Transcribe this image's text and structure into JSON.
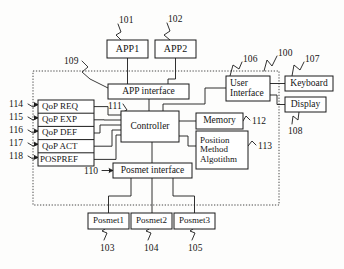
{
  "figure": {
    "boundary_name": "system-boundary-dashed",
    "line_color": "#1a1a1a",
    "box_fill": "#ffffff",
    "background": "#fdfdfc"
  },
  "blocks": {
    "app1": {
      "label": "APP1",
      "x": 107,
      "y": 40,
      "w": 41,
      "h": 18,
      "fs": 10
    },
    "app2": {
      "label": "APP2",
      "x": 155,
      "y": 40,
      "w": 41,
      "h": 18,
      "fs": 10
    },
    "app_interface": {
      "label": "APP interface",
      "x": 108,
      "y": 84,
      "w": 81,
      "h": 15,
      "fs": 9.5
    },
    "controller": {
      "label": "Controller",
      "x": 121,
      "y": 111,
      "w": 58,
      "h": 31,
      "fs": 9.5
    },
    "memory": {
      "label": "Memory",
      "x": 196,
      "y": 113,
      "w": 47,
      "h": 16,
      "fs": 9.5
    },
    "position_method": {
      "label": "Position\nMethod\nAlgotithm",
      "x": 196,
      "y": 131,
      "w": 52,
      "h": 38,
      "fs": 9
    },
    "user_interface": {
      "label": "User\nInterface",
      "x": 226,
      "y": 76,
      "w": 44,
      "h": 25,
      "fs": 9.5
    },
    "keyboard": {
      "label": "Keyboard",
      "x": 285,
      "y": 76,
      "w": 48,
      "h": 15,
      "fs": 9.5
    },
    "display": {
      "label": "Display",
      "x": 285,
      "y": 97,
      "w": 41,
      "h": 15,
      "fs": 9.5
    },
    "posmet_interface": {
      "label": "Posmet interface",
      "x": 113,
      "y": 163,
      "w": 79,
      "h": 15,
      "fs": 9.5
    },
    "posmet1": {
      "label": "Posmet1",
      "x": 88,
      "y": 213,
      "w": 41,
      "h": 16,
      "fs": 9
    },
    "posmet2": {
      "label": "Posmet2",
      "x": 131,
      "y": 213,
      "w": 41,
      "h": 16,
      "fs": 9
    },
    "posmet3": {
      "label": "Posmet3",
      "x": 174,
      "y": 213,
      "w": 41,
      "h": 16,
      "fs": 9
    }
  },
  "qop_stack": {
    "x": 38,
    "y": 100,
    "w": 56,
    "row_h": 13.2,
    "rows": [
      {
        "label": "QoP REQ",
        "ref": "114"
      },
      {
        "label": "QoP EXP",
        "ref": "115"
      },
      {
        "label": "QoP DEF",
        "ref": "116"
      },
      {
        "label": "QoP ACT",
        "ref": "117"
      },
      {
        "label": "POSPREF",
        "ref": "118"
      }
    ],
    "fs": 9
  },
  "ref_numbers": [
    {
      "id": "ref-101",
      "text": "101",
      "x": 119,
      "y": 15
    },
    {
      "id": "ref-102",
      "text": "102",
      "x": 168,
      "y": 14
    },
    {
      "id": "ref-109",
      "text": "109",
      "x": 64,
      "y": 56
    },
    {
      "id": "ref-106",
      "text": "106",
      "x": 243,
      "y": 54
    },
    {
      "id": "ref-100",
      "text": "100",
      "x": 278,
      "y": 48
    },
    {
      "id": "ref-107",
      "text": "107",
      "x": 305,
      "y": 54
    },
    {
      "id": "ref-108",
      "text": "108",
      "x": 288,
      "y": 126
    },
    {
      "id": "ref-111",
      "text": "111",
      "x": 108,
      "y": 101
    },
    {
      "id": "ref-112",
      "text": "112",
      "x": 252,
      "y": 116
    },
    {
      "id": "ref-113",
      "text": "113",
      "x": 258,
      "y": 141
    },
    {
      "id": "ref-110",
      "text": "110",
      "x": 88,
      "y": 166
    },
    {
      "id": "ref-114",
      "text": "114",
      "x": 12,
      "y": 100
    },
    {
      "id": "ref-115",
      "text": "115",
      "x": 12,
      "y": 113
    },
    {
      "id": "ref-116",
      "text": "116",
      "x": 12,
      "y": 126
    },
    {
      "id": "ref-117",
      "text": "117",
      "x": 12,
      "y": 139
    },
    {
      "id": "ref-118",
      "text": "118",
      "x": 12,
      "y": 152
    },
    {
      "id": "ref-103",
      "text": "103",
      "x": 100,
      "y": 243
    },
    {
      "id": "ref-104",
      "text": "104",
      "x": 144,
      "y": 243
    },
    {
      "id": "ref-105",
      "text": "105",
      "x": 188,
      "y": 243
    }
  ]
}
